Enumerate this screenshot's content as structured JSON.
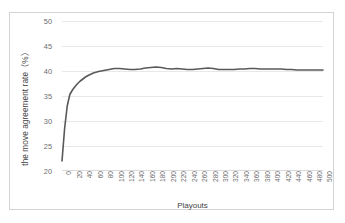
{
  "chart_data": {
    "type": "line",
    "title": "",
    "xlabel": "Playouts",
    "ylabel": "the move agreement rate（%）",
    "xlim": [
      0,
      500
    ],
    "ylim": [
      20,
      50
    ],
    "ytick_labels": [
      "50",
      "45",
      "40",
      "35",
      "30",
      "25",
      "20"
    ],
    "ytick_values": [
      50,
      45,
      40,
      35,
      30,
      25,
      20
    ],
    "xtick_labels": [
      "0",
      "20",
      "40",
      "60",
      "80",
      "100",
      "120",
      "140",
      "160",
      "180",
      "200",
      "220",
      "240",
      "260",
      "280",
      "300",
      "320",
      "340",
      "360",
      "380",
      "400",
      "420",
      "440",
      "460",
      "480",
      "500"
    ],
    "xtick_values": [
      0,
      20,
      40,
      60,
      80,
      100,
      120,
      140,
      160,
      180,
      200,
      220,
      240,
      260,
      280,
      300,
      320,
      340,
      360,
      380,
      400,
      420,
      440,
      460,
      480,
      500
    ],
    "grid": "horizontal",
    "legend": "none",
    "line_color": "#595959",
    "series": [
      {
        "name": "move agreement rate",
        "x": [
          0,
          5,
          10,
          15,
          20,
          25,
          30,
          35,
          40,
          45,
          50,
          60,
          70,
          80,
          90,
          100,
          110,
          120,
          130,
          140,
          150,
          160,
          170,
          180,
          190,
          200,
          210,
          220,
          230,
          240,
          250,
          260,
          270,
          280,
          290,
          300,
          310,
          320,
          330,
          340,
          350,
          360,
          370,
          380,
          390,
          400,
          410,
          420,
          430,
          440,
          450,
          460,
          470,
          480,
          490,
          500
        ],
        "values": [
          22.0,
          28.5,
          33.0,
          35.3,
          36.2,
          36.9,
          37.5,
          38.0,
          38.4,
          38.8,
          39.1,
          39.6,
          39.9,
          40.1,
          40.3,
          40.5,
          40.5,
          40.4,
          40.3,
          40.3,
          40.4,
          40.6,
          40.7,
          40.8,
          40.7,
          40.5,
          40.4,
          40.5,
          40.4,
          40.3,
          40.3,
          40.4,
          40.5,
          40.6,
          40.5,
          40.3,
          40.3,
          40.3,
          40.3,
          40.4,
          40.4,
          40.5,
          40.5,
          40.4,
          40.4,
          40.4,
          40.4,
          40.4,
          40.3,
          40.3,
          40.2,
          40.2,
          40.2,
          40.2,
          40.2,
          40.2
        ]
      }
    ]
  }
}
